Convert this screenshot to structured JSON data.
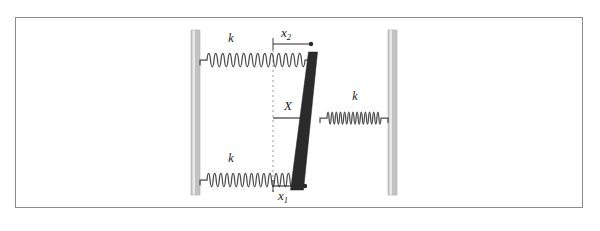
{
  "figure": {
    "title": "",
    "frame": {
      "x": 15,
      "y": 17,
      "width": 568,
      "height": 191,
      "border_color": "#8c8c8c",
      "background_color": "#ffffff"
    },
    "walls": [
      {
        "name": "left-wall",
        "x": 191,
        "y": 30,
        "width": 9,
        "height": 165,
        "color": "#c2c2c2",
        "highlight_color": "#e8e8e8"
      },
      {
        "name": "right-wall",
        "x": 388,
        "y": 30,
        "width": 9,
        "height": 165,
        "color": "#c2c2c2",
        "highlight_color": "#e8e8e8"
      }
    ],
    "bar": {
      "name": "tilted-rigid-bar",
      "color": "#2b2b2b",
      "top_x": 313,
      "bottom_x": 297,
      "top_y": 52,
      "bottom_y": 190,
      "thickness_top": 9,
      "thickness_bottom": 13
    },
    "springs": [
      {
        "name": "upper-left-spring",
        "label": "k",
        "label_x": 231,
        "label_y": 42,
        "x1": 200,
        "x2": 312,
        "y": 60,
        "coils": 14,
        "amplitude": 9,
        "color": "#4a4a4a"
      },
      {
        "name": "lower-left-spring",
        "label": "k",
        "label_x": 231,
        "label_y": 162,
        "x1": 200,
        "x2": 300,
        "y": 180,
        "coils": 14,
        "amplitude": 9,
        "color": "#4a4a4a"
      },
      {
        "name": "right-spring",
        "label": "k",
        "label_x": 355,
        "label_y": 100,
        "x1": 320,
        "x2": 388,
        "y": 118,
        "coils": 13,
        "amplitude": 8,
        "color": "#4a4a4a"
      }
    ],
    "reference_line": {
      "name": "equilibrium-dashed-line",
      "x": 273,
      "y1": 50,
      "y2": 192,
      "color": "#9a9a9a",
      "dash": "2,3"
    },
    "dimensions": [
      {
        "name": "x2-dimension",
        "label": "x",
        "subscript": "2",
        "label_x": 288,
        "label_y": 37,
        "line_y": 44,
        "line_x1": 273,
        "line_x2": 312,
        "tick_top": 38,
        "tick_bottom": 49,
        "arrow": "right",
        "color": "#2b2b2b"
      },
      {
        "name": "x1-dimension",
        "label": "x",
        "subscript": "1",
        "label_x": 284,
        "label_y": 200,
        "line_y": 186,
        "line_x1": 273,
        "line_x2": 305,
        "tick_top": 180,
        "tick_bottom": 192,
        "arrow": "right",
        "color": "#2b2b2b"
      },
      {
        "name": "X-dimension",
        "label": "X",
        "subscript": "",
        "label_x": 288,
        "label_y": 106,
        "line_y": 118,
        "line_x1": 273,
        "line_x2": 305,
        "arrow": "right",
        "color": "#2b2b2b"
      }
    ]
  }
}
